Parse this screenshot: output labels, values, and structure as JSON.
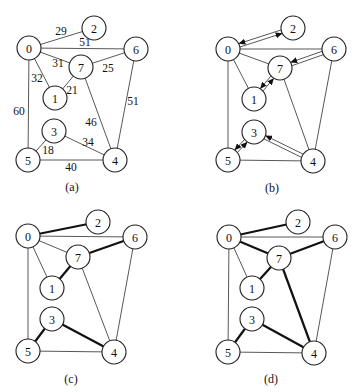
{
  "figure": {
    "node_radius": 12,
    "colors": {
      "edge": "#444444",
      "bold_edge": "#111111",
      "node_fill": "#ffffff",
      "node_stroke": "#222222",
      "text": "#111111"
    }
  },
  "graph": {
    "nodes": [
      "0",
      "1",
      "2",
      "3",
      "4",
      "5",
      "6",
      "7"
    ],
    "edges": [
      {
        "u": "0",
        "v": "2",
        "weight": "29"
      },
      {
        "u": "0",
        "v": "6",
        "weight": "51"
      },
      {
        "u": "0",
        "v": "7",
        "weight": "31"
      },
      {
        "u": "0",
        "v": "1",
        "weight": "32"
      },
      {
        "u": "0",
        "v": "5",
        "weight": "60"
      },
      {
        "u": "7",
        "v": "6",
        "weight": "25"
      },
      {
        "u": "7",
        "v": "1",
        "weight": "21"
      },
      {
        "u": "7",
        "v": "4",
        "weight": "46"
      },
      {
        "u": "6",
        "v": "4",
        "weight": "51"
      },
      {
        "u": "3",
        "v": "5",
        "weight": "18"
      },
      {
        "u": "3",
        "v": "4",
        "weight": "34"
      },
      {
        "u": "5",
        "v": "4",
        "weight": "40"
      }
    ]
  },
  "panels": [
    {
      "id": "a",
      "caption": "(a)",
      "caption_pos": [
        72,
        187
      ],
      "nodes": {
        "0": [
          29,
          48
        ],
        "1": [
          55,
          98
        ],
        "2": [
          94,
          28
        ],
        "3": [
          54,
          131
        ],
        "4": [
          115,
          160
        ],
        "5": [
          28,
          160
        ],
        "6": [
          136,
          49
        ],
        "7": [
          81,
          67
        ]
      },
      "bold_edges": [],
      "arrow_edges": [],
      "weight_labels": [
        {
          "text": "29",
          "pos": [
            61,
            31
          ]
        },
        {
          "text": "51",
          "pos": [
            85,
            42
          ]
        },
        {
          "text": "31",
          "pos": [
            58,
            63
          ]
        },
        {
          "text": "25",
          "pos": [
            108,
            68
          ]
        },
        {
          "text": "32",
          "pos": [
            37,
            78
          ]
        },
        {
          "text": "21",
          "pos": [
            72,
            90
          ]
        },
        {
          "text": "60",
          "pos": [
            19,
            111
          ]
        },
        {
          "text": "51",
          "pos": [
            133,
            101
          ]
        },
        {
          "text": "46",
          "pos": [
            91,
            122
          ]
        },
        {
          "text": "34",
          "pos": [
            88,
            142
          ]
        },
        {
          "text": "18",
          "pos": [
            48,
            150
          ]
        },
        {
          "text": "40",
          "pos": [
            71,
            167
          ]
        }
      ]
    },
    {
      "id": "b",
      "caption": "(b)",
      "caption_pos": [
        272,
        188
      ],
      "nodes": {
        "0": [
          228,
          49
        ],
        "1": [
          254,
          99
        ],
        "2": [
          293,
          28
        ],
        "3": [
          254,
          132
        ],
        "4": [
          313,
          161
        ],
        "5": [
          228,
          160
        ],
        "6": [
          334,
          49
        ],
        "7": [
          280,
          68
        ]
      },
      "bold_edges": [],
      "arrow_edges": [
        {
          "u": "0",
          "v": "2",
          "arrows": [
            "to_v",
            "to_u"
          ]
        },
        {
          "u": "6",
          "v": "7",
          "arrows": [
            "to_v"
          ]
        },
        {
          "u": "1",
          "v": "7",
          "arrows": [
            "to_v",
            "to_u"
          ]
        },
        {
          "u": "5",
          "v": "3",
          "arrows": [
            "to_v",
            "to_u"
          ]
        },
        {
          "u": "4",
          "v": "3",
          "arrows": [
            "to_v"
          ]
        }
      ],
      "weight_labels": []
    },
    {
      "id": "c",
      "caption": "(c)",
      "caption_pos": [
        71,
        379
      ],
      "nodes": {
        "0": [
          28,
          236
        ],
        "1": [
          52,
          288
        ],
        "2": [
          98,
          222
        ],
        "3": [
          52,
          319
        ],
        "4": [
          114,
          352
        ],
        "5": [
          28,
          351
        ],
        "6": [
          135,
          237
        ],
        "7": [
          78,
          257
        ]
      },
      "bold_edges": [
        [
          "0",
          "2"
        ],
        [
          "7",
          "6"
        ],
        [
          "7",
          "1"
        ],
        [
          "3",
          "5"
        ],
        [
          "3",
          "4"
        ]
      ],
      "arrow_edges": [],
      "weight_labels": []
    },
    {
      "id": "d",
      "caption": "(d)",
      "caption_pos": [
        271,
        379
      ],
      "nodes": {
        "0": [
          229,
          237
        ],
        "1": [
          252,
          288
        ],
        "2": [
          298,
          222
        ],
        "3": [
          252,
          319
        ],
        "4": [
          314,
          353
        ],
        "5": [
          228,
          352
        ],
        "6": [
          335,
          237
        ],
        "7": [
          279,
          258
        ]
      },
      "bold_edges": [
        [
          "0",
          "2"
        ],
        [
          "0",
          "7"
        ],
        [
          "7",
          "6"
        ],
        [
          "7",
          "1"
        ],
        [
          "7",
          "4"
        ],
        [
          "3",
          "5"
        ],
        [
          "3",
          "4"
        ]
      ],
      "arrow_edges": [],
      "weight_labels": []
    }
  ]
}
